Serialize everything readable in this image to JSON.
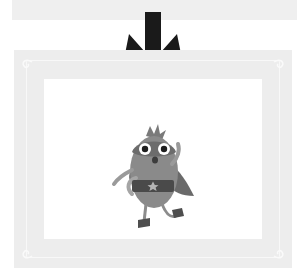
{
  "diagram": {
    "top_panel": {
      "label": "previous-step-panel"
    },
    "arrow": {
      "direction": "down",
      "color": "#1a1a1a"
    },
    "frame": {
      "color": "#ededed",
      "inner_color": "#ffffff",
      "content": "cartoon superhero bird character with cape and star belt"
    },
    "colors": {
      "character_body": "#8a8a8a",
      "character_dark": "#5a5a5a",
      "cape": "#6a6a6a",
      "belt": "#4a4a4a",
      "star": "#b5b5b5"
    }
  }
}
